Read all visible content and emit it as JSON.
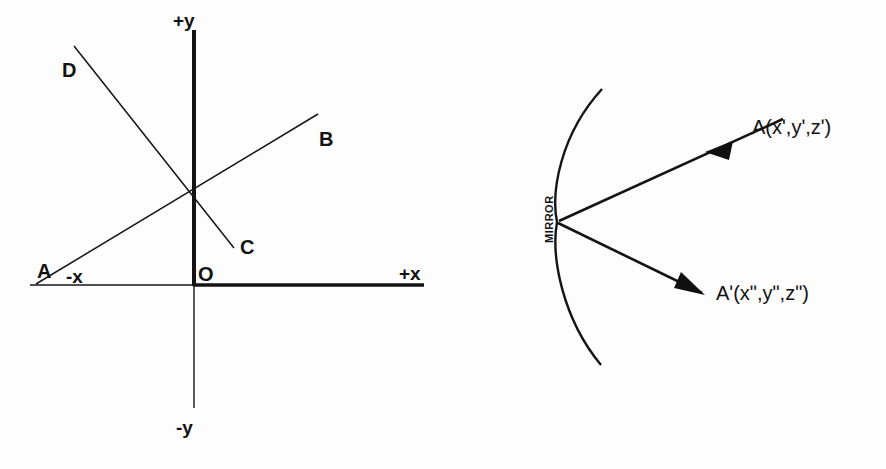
{
  "figure": {
    "background_color": "#fdfdfd",
    "ink_color": "#141414",
    "panels": [
      "coordinate-axes-panel",
      "mirror-reflection-panel"
    ]
  },
  "left_diagram": {
    "name": "coordinate-axes-diagram",
    "axis_labels": {
      "positive_y": "+y",
      "negative_y": "-y",
      "positive_x": "+x",
      "negative_x": "-x",
      "origin": "O"
    },
    "point_labels": {
      "a": "A",
      "b": "B",
      "c": "C",
      "d": "D"
    },
    "lines": [
      {
        "name": "line-ab",
        "from": "A",
        "to": "B"
      },
      {
        "name": "line-dc",
        "from": "D",
        "to": "C"
      }
    ]
  },
  "right_diagram": {
    "name": "mirror-reflection-diagram",
    "mirror_label": "MIRROR",
    "incident_ray_label": "A(xʹ,yʹ,zʹ)",
    "reflected_ray_label": "Aʹ(xʺ,yʺ,zʺ)",
    "rays": [
      {
        "name": "incident-ray",
        "label": "A(xʹ,yʹ,zʹ)",
        "direction": "toward-mirror"
      },
      {
        "name": "reflected-ray",
        "label": "Aʹ(xʺ,yʺ,zʺ)",
        "direction": "away-from-mirror"
      }
    ]
  }
}
